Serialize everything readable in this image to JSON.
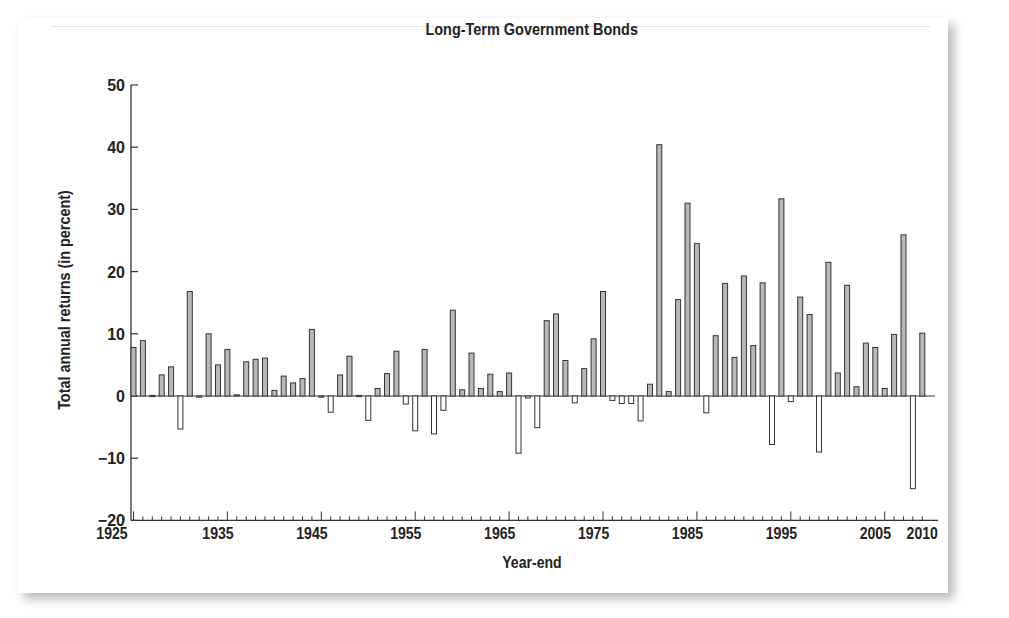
{
  "chart_data": {
    "type": "bar",
    "title": "Long-Term Government Bonds",
    "xlabel": "Year-end",
    "ylabel": "Total annual returns (in percent)",
    "ylim": [
      -20,
      50
    ],
    "yticks": [
      -20,
      -10,
      0,
      10,
      20,
      30,
      40,
      50
    ],
    "xtick_labels": [
      "1925",
      "1935",
      "1945",
      "1955",
      "1965",
      "1975",
      "1985",
      "1995",
      "2005",
      "2010"
    ],
    "grid": false,
    "legend": null,
    "categories": [
      1926,
      1927,
      1928,
      1929,
      1930,
      1931,
      1932,
      1933,
      1934,
      1935,
      1936,
      1937,
      1938,
      1939,
      1940,
      1941,
      1942,
      1943,
      1944,
      1945,
      1946,
      1947,
      1948,
      1949,
      1950,
      1951,
      1952,
      1953,
      1954,
      1955,
      1956,
      1957,
      1958,
      1959,
      1960,
      1961,
      1962,
      1963,
      1964,
      1965,
      1966,
      1967,
      1968,
      1969,
      1970,
      1971,
      1972,
      1973,
      1974,
      1975,
      1976,
      1977,
      1978,
      1979,
      1980,
      1981,
      1982,
      1983,
      1984,
      1985,
      1986,
      1987,
      1988,
      1989,
      1990,
      1991,
      1992,
      1993,
      1994,
      1995,
      1996,
      1997,
      1998,
      1999,
      2000,
      2001,
      2002,
      2003,
      2004,
      2005,
      2006,
      2007,
      2008,
      2009,
      2010
    ],
    "values": [
      7.8,
      8.9,
      0.1,
      3.4,
      4.7,
      -5.3,
      16.8,
      -0.1,
      10.0,
      5.0,
      7.5,
      0.2,
      5.5,
      5.9,
      6.1,
      0.9,
      3.2,
      2.1,
      2.8,
      10.7,
      -0.1,
      -2.6,
      3.4,
      6.4,
      0.1,
      -3.9,
      1.2,
      3.6,
      7.2,
      -1.3,
      -5.6,
      7.5,
      -6.1,
      -2.3,
      13.8,
      1.0,
      6.9,
      1.2,
      3.5,
      0.7,
      3.7,
      -9.2,
      -0.3,
      -5.1,
      12.1,
      13.2,
      5.7,
      -1.1,
      4.4,
      9.2,
      16.8,
      -0.7,
      -1.2,
      -1.2,
      -4.0,
      1.9,
      40.4,
      0.7,
      15.5,
      31.0,
      24.5,
      -2.7,
      9.7,
      18.1,
      6.2,
      19.3,
      8.1,
      18.2,
      -7.8,
      31.7,
      -0.9,
      15.9,
      13.1,
      -9.0,
      21.5,
      3.7,
      17.8,
      1.5,
      8.5,
      7.8,
      1.2,
      9.9,
      25.9,
      -14.9,
      10.1
    ]
  },
  "colors": {
    "positive_fill": "#b8b8b8",
    "negative_fill": "#ffffff",
    "stroke": "#333333"
  }
}
